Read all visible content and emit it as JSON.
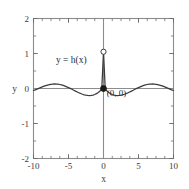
{
  "figure": {
    "background_color": "#ffffff",
    "frame_color": "#8c8c8c",
    "curve_color": "#3b3b3b",
    "text_color": "#2b2b2b",
    "tick_color": "#6e6e6e"
  },
  "chart_data": {
    "type": "line",
    "title": "",
    "subtitle": "",
    "xlabel": "x",
    "ylabel": "y",
    "xlim": [
      -10,
      10
    ],
    "ylim": [
      -2,
      2
    ],
    "xticks": [
      -10,
      -5,
      0,
      5,
      10
    ],
    "xtick_labels": [
      "-10",
      "-5",
      "0",
      "5",
      "10"
    ],
    "yticks": [
      -2,
      -1,
      0,
      1,
      2
    ],
    "ytick_labels": [
      "-2",
      "-1",
      "0",
      "1",
      "2"
    ],
    "minor_xtick_step": 1.25,
    "minor_ytick_step": 0.5,
    "grid": false,
    "legend": null,
    "series": [
      {
        "name": "h(x)",
        "label": "y = h(x)",
        "description": "damped oscillation, sinc-like: peak near 1.05 at x=0, decaying side lobes",
        "x": [
          -10.0,
          -9.75,
          -9.5,
          -9.25,
          -9.0,
          -8.75,
          -8.5,
          -8.25,
          -8.0,
          -7.75,
          -7.5,
          -7.25,
          -7.0,
          -6.75,
          -6.5,
          -6.25,
          -6.0,
          -5.75,
          -5.5,
          -5.25,
          -5.0,
          -4.75,
          -4.5,
          -4.25,
          -4.0,
          -3.75,
          -3.5,
          -3.25,
          -3.0,
          -2.75,
          -2.5,
          -2.25,
          -2.0,
          -1.75,
          -1.5,
          -1.25,
          -1.0,
          -0.75,
          -0.5,
          -0.25,
          0.0,
          0.25,
          0.5,
          0.75,
          1.0,
          1.25,
          1.5,
          1.75,
          2.0,
          2.25,
          2.5,
          2.75,
          3.0,
          3.25,
          3.5,
          3.75,
          4.0,
          4.25,
          4.5,
          4.75,
          5.0,
          5.25,
          5.5,
          5.75,
          6.0,
          6.25,
          6.5,
          6.75,
          7.0,
          7.25,
          7.5,
          7.75,
          8.0,
          8.25,
          8.5,
          8.75,
          9.0,
          9.25,
          9.5,
          9.75,
          10.0
        ],
        "y": [
          -0.057,
          -0.038,
          -0.017,
          0.005,
          0.026,
          0.047,
          0.066,
          0.083,
          0.099,
          0.111,
          0.12,
          0.126,
          0.129,
          0.127,
          0.123,
          0.114,
          0.102,
          0.087,
          0.069,
          0.048,
          0.026,
          0.002,
          -0.023,
          -0.049,
          -0.074,
          -0.099,
          -0.123,
          -0.144,
          -0.164,
          -0.18,
          -0.192,
          -0.199,
          -0.202,
          -0.198,
          -0.188,
          -0.171,
          -0.147,
          -0.114,
          -0.073,
          -0.025,
          1.05,
          -0.025,
          -0.073,
          -0.114,
          -0.147,
          -0.171,
          -0.188,
          -0.198,
          -0.202,
          -0.199,
          -0.192,
          -0.18,
          -0.164,
          -0.144,
          -0.123,
          -0.099,
          -0.074,
          -0.049,
          -0.023,
          0.002,
          0.026,
          0.048,
          0.069,
          0.087,
          0.102,
          0.114,
          0.123,
          0.127,
          0.129,
          0.126,
          0.12,
          0.111,
          0.099,
          0.083,
          0.066,
          0.047,
          0.026,
          0.005,
          -0.017,
          -0.038,
          -0.057
        ],
        "curve_color": "#3b3b3b"
      }
    ],
    "annotations": [
      {
        "name": "curve-label",
        "text": "y = h(x)",
        "x": -4.6,
        "y": 0.72
      },
      {
        "name": "origin-label",
        "text": "(0, 0)",
        "x": 0.45,
        "y": -0.22
      }
    ],
    "markers": [
      {
        "name": "open-circle-limit",
        "style": "open",
        "x": 0,
        "y": 1.05,
        "fill": "#ffffff",
        "stroke": "#3b3b3b"
      },
      {
        "name": "filled-point-origin",
        "style": "filled",
        "x": 0,
        "y": 0,
        "fill": "#1a1a1a",
        "stroke": "#1a1a1a"
      }
    ],
    "reference_lines": [
      {
        "name": "x-axis-line",
        "orientation": "horizontal",
        "value": 0
      },
      {
        "name": "y-axis-line",
        "orientation": "vertical",
        "value": 0
      }
    ]
  }
}
